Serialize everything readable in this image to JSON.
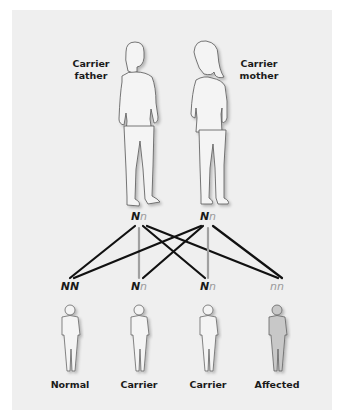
{
  "parents": {
    "father": {
      "label_line1": "Carrier",
      "label_line2": "father",
      "genotype": {
        "dominant": "N",
        "recessive": "n"
      }
    },
    "mother": {
      "label_line1": "Carrier",
      "label_line2": "mother",
      "genotype": {
        "dominant": "N",
        "recessive": "n"
      }
    }
  },
  "offspring": [
    {
      "genotype_a": "N",
      "genotype_b": "N",
      "allele_a_type": "dominant",
      "allele_b_type": "dominant",
      "label": "Normal",
      "affected": false
    },
    {
      "genotype_a": "N",
      "genotype_b": "n",
      "allele_a_type": "dominant",
      "allele_b_type": "recessive",
      "label": "Carrier",
      "affected": false
    },
    {
      "genotype_a": "N",
      "genotype_b": "n",
      "allele_a_type": "dominant",
      "allele_b_type": "recessive",
      "label": "Carrier",
      "affected": false
    },
    {
      "genotype_a": "n",
      "genotype_b": "n",
      "allele_a_type": "recessive",
      "allele_b_type": "recessive",
      "label": "Affected",
      "affected": true
    }
  ],
  "colors": {
    "panel_background": "#efefef",
    "dominant_line": "#111111",
    "recessive_line": "#a0a0a0",
    "affected_fill": "#c8c8c8",
    "figure_stroke": "#555555"
  }
}
